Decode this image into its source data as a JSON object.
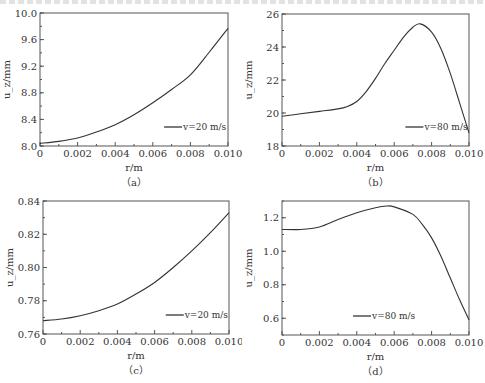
{
  "figure": {
    "panels": [
      "a",
      "b",
      "c",
      "d"
    ]
  },
  "chart_data": [
    {
      "id": "a",
      "type": "line",
      "caption": "（a）",
      "title": "",
      "xlabel": "r/m",
      "ylabel": "u_z/mm",
      "xlim": [
        0,
        0.01
      ],
      "ylim": [
        8.0,
        10.0
      ],
      "xticks": [
        "0",
        "0.002",
        "0.004",
        "0.006",
        "0.008",
        "0.010"
      ],
      "yticks": [
        "8.0",
        "8.4",
        "8.8",
        "9.2",
        "9.6",
        "10.0"
      ],
      "grid": false,
      "legend_position": "lower right",
      "series": [
        {
          "name": "v=20 m/s",
          "x": [
            0,
            0.001,
            0.002,
            0.003,
            0.004,
            0.005,
            0.006,
            0.007,
            0.008,
            0.009,
            0.01
          ],
          "values": [
            8.04,
            8.07,
            8.12,
            8.21,
            8.32,
            8.47,
            8.65,
            8.85,
            9.07,
            9.41,
            9.77
          ]
        }
      ]
    },
    {
      "id": "b",
      "type": "line",
      "caption": "（b）",
      "title": "",
      "xlabel": "r/m",
      "ylabel": "u_z/mm",
      "xlim": [
        0,
        0.01
      ],
      "ylim": [
        18,
        26
      ],
      "xticks": [
        "0",
        "0.002",
        "0.004",
        "0.006",
        "0.008",
        "0.010"
      ],
      "yticks": [
        "18",
        "20",
        "22",
        "24",
        "26"
      ],
      "grid": false,
      "legend_position": "lower right",
      "series": [
        {
          "name": "v=80 m/s",
          "x": [
            0,
            0.001,
            0.002,
            0.003,
            0.0035,
            0.004,
            0.0045,
            0.005,
            0.0055,
            0.006,
            0.0065,
            0.007,
            0.0074,
            0.008,
            0.0085,
            0.009,
            0.0095,
            0.01
          ],
          "values": [
            19.8,
            19.95,
            20.1,
            20.25,
            20.4,
            20.7,
            21.3,
            22.1,
            23.0,
            23.8,
            24.6,
            25.2,
            25.4,
            24.9,
            23.9,
            22.4,
            20.6,
            18.8
          ]
        }
      ]
    },
    {
      "id": "c",
      "type": "line",
      "caption": "（c）",
      "title": "",
      "xlabel": "r/m",
      "ylabel": "u_z/mm",
      "xlim": [
        0,
        0.01
      ],
      "ylim": [
        0.76,
        0.84
      ],
      "xticks": [
        "0",
        "0.002",
        "0.004",
        "0.006",
        "0.008",
        "0.010"
      ],
      "yticks": [
        "0.76",
        "0.78",
        "0.80",
        "0.82",
        "0.84"
      ],
      "grid": false,
      "legend_position": "lower right",
      "series": [
        {
          "name": "v=20 m/s",
          "x": [
            0,
            0.001,
            0.002,
            0.003,
            0.004,
            0.005,
            0.006,
            0.007,
            0.008,
            0.009,
            0.01
          ],
          "values": [
            0.768,
            0.769,
            0.771,
            0.774,
            0.778,
            0.784,
            0.791,
            0.8,
            0.81,
            0.821,
            0.833
          ]
        }
      ]
    },
    {
      "id": "d",
      "type": "line",
      "caption": "（d）",
      "title": "",
      "xlabel": "r/m",
      "ylabel": "u_z/mm",
      "xlim": [
        0,
        0.01
      ],
      "ylim": [
        0.5,
        1.3
      ],
      "xticks": [
        "0",
        "0.002",
        "0.004",
        "0.006",
        "0.008",
        "0.010"
      ],
      "yticks": [
        "0.6",
        "0.8",
        "1.0",
        "1.2"
      ],
      "grid": false,
      "legend_position": "lower center",
      "series": [
        {
          "name": "v=80 m/s",
          "x": [
            0,
            0.001,
            0.002,
            0.003,
            0.004,
            0.005,
            0.0056,
            0.006,
            0.007,
            0.0075,
            0.008,
            0.0085,
            0.009,
            0.0095,
            0.01
          ],
          "values": [
            1.13,
            1.13,
            1.145,
            1.19,
            1.23,
            1.26,
            1.27,
            1.265,
            1.22,
            1.16,
            1.08,
            0.97,
            0.84,
            0.71,
            0.59
          ]
        }
      ]
    }
  ]
}
